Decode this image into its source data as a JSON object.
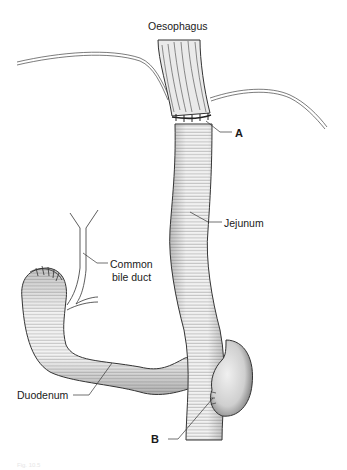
{
  "figure": {
    "caption": "Fig. 10.5",
    "labels": {
      "oesophagus": "Oesophagus",
      "a": "A",
      "jejunum": "Jejunum",
      "common_bile_duct_line1": "Common",
      "common_bile_duct_line2": "bile duct",
      "duodenum": "Duodenum",
      "b": "B"
    },
    "colors": {
      "tissue_fill": "#eeeeee",
      "outline": "#333333",
      "hatch": "#555555",
      "shadow": "#9a9a9a"
    }
  }
}
